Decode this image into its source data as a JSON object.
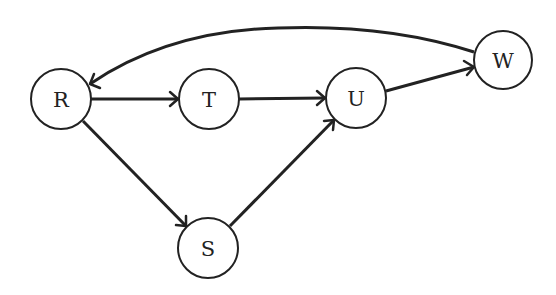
{
  "diagram": {
    "type": "directed-graph",
    "stroke_color": "#222222",
    "background": "#ffffff",
    "nodes": [
      {
        "id": "R",
        "label": "R",
        "cx": 61,
        "cy": 99,
        "r": 30
      },
      {
        "id": "T",
        "label": "T",
        "cx": 209,
        "cy": 99,
        "r": 30
      },
      {
        "id": "U",
        "label": "U",
        "cx": 356,
        "cy": 98,
        "r": 30
      },
      {
        "id": "W",
        "label": "W",
        "cx": 503,
        "cy": 60,
        "r": 29
      },
      {
        "id": "S",
        "label": "S",
        "cx": 208,
        "cy": 248,
        "r": 30
      }
    ],
    "edges": [
      {
        "from": "R",
        "to": "T"
      },
      {
        "from": "T",
        "to": "U"
      },
      {
        "from": "R",
        "to": "S"
      },
      {
        "from": "S",
        "to": "U"
      },
      {
        "from": "U",
        "to": "W"
      },
      {
        "from": "W",
        "to": "R",
        "curved": true
      }
    ]
  }
}
